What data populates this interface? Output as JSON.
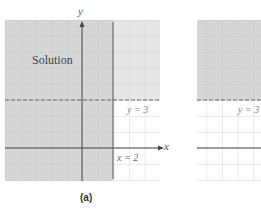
{
  "panels": [
    {
      "id": "a",
      "caption": "(a)",
      "region_label": "Solution",
      "axis_x_label": "x",
      "axis_y_label": "y",
      "line_vertical": {
        "label": "x = 2",
        "value": 2,
        "style": "solid"
      },
      "line_horizontal": {
        "label": "y = 3",
        "value": 3,
        "style": "dashed"
      }
    },
    {
      "id": "b",
      "line_horizontal": {
        "label": "y = 3",
        "value": 3,
        "style": "dashed"
      }
    }
  ],
  "colors": {
    "shade_dark": "#d2d2d2",
    "shade_light": "#e4e4e4",
    "grid": "#bdbdbd",
    "axis": "#444444",
    "dash": "#666666",
    "label": "#555555"
  }
}
